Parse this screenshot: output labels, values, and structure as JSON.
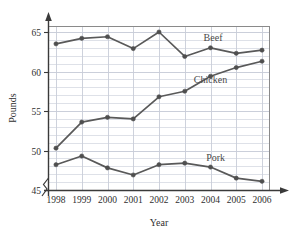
{
  "chart_data": {
    "type": "line",
    "title": "",
    "xlabel": "Year",
    "ylabel": "Pounds",
    "categories": [
      "1998",
      "1999",
      "2000",
      "2001",
      "2002",
      "2003",
      "2004",
      "2005",
      "2006"
    ],
    "x": [
      1998,
      1999,
      2000,
      2001,
      2002,
      2003,
      2004,
      2005,
      2006
    ],
    "xlim": [
      1998,
      2006
    ],
    "ylim": [
      45,
      66
    ],
    "y_axis_break": true,
    "y_ticks": [
      45,
      50,
      55,
      60,
      65
    ],
    "y_minor_tick_step": 1,
    "grid": true,
    "legend_position": "inline-right",
    "series": [
      {
        "name": "Beef",
        "color": "#595959",
        "values": [
          63.5,
          64.2,
          64.4,
          62.9,
          65.0,
          61.9,
          63.0,
          62.3,
          62.7
        ],
        "label_x": 2004.1,
        "label_y": 63.9
      },
      {
        "name": "Chicken",
        "color": "#595959",
        "values": [
          50.3,
          53.6,
          54.2,
          54.0,
          56.8,
          57.5,
          59.4,
          60.5,
          61.3
        ],
        "label_x": 2004.0,
        "label_y": 58.6
      },
      {
        "name": "Pork",
        "color": "#595959",
        "values": [
          48.2,
          49.3,
          47.8,
          46.9,
          48.2,
          48.4,
          47.9,
          46.5,
          46.1
        ],
        "label_x": 2004.2,
        "label_y": 48.7
      }
    ]
  },
  "axes": {
    "y_label": "Pounds",
    "x_label": "Year",
    "y_tick_labels": [
      "45",
      "50",
      "55",
      "60",
      "65"
    ],
    "x_tick_labels": [
      "1998",
      "1999",
      "2000",
      "2001",
      "2002",
      "2003",
      "2004",
      "2005",
      "2006"
    ]
  },
  "legend": {
    "beef": "Beef",
    "chicken": "Chicken",
    "pork": "Pork"
  },
  "style": {
    "line_color": "#595959",
    "marker_color": "#4f4f4f",
    "grid_color": "#c8cdd8",
    "frame_color": "#8a8a8a",
    "axis_color": "#3a3a3a",
    "background": "#ffffff"
  }
}
